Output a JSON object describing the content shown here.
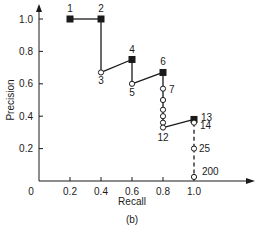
{
  "chart_data": {
    "type": "line",
    "title": "",
    "caption": "(b)",
    "xlabel": "Recall",
    "ylabel": "Precision",
    "xlim": [
      0,
      1.0
    ],
    "ylim": [
      0,
      1.0
    ],
    "grid": false,
    "x_ticks": [
      "0",
      "0.2",
      "0.4",
      "0.6",
      "0.8",
      "1.0"
    ],
    "y_ticks": [
      "0.2",
      "0.4",
      "0.6",
      "0.8",
      "1.0"
    ],
    "legend": null,
    "series": [
      {
        "name": "precision-recall",
        "points": [
          {
            "label": "1",
            "rank": 1,
            "recall": 0.2,
            "precision": 1.0,
            "relevant": true
          },
          {
            "label": "2",
            "rank": 2,
            "recall": 0.4,
            "precision": 1.0,
            "relevant": true
          },
          {
            "label": "3",
            "rank": 3,
            "recall": 0.4,
            "precision": 0.67,
            "relevant": false
          },
          {
            "label": "4",
            "rank": 4,
            "recall": 0.6,
            "precision": 0.75,
            "relevant": true
          },
          {
            "label": "5",
            "rank": 5,
            "recall": 0.6,
            "precision": 0.6,
            "relevant": false
          },
          {
            "label": "6",
            "rank": 6,
            "recall": 0.8,
            "precision": 0.67,
            "relevant": true
          },
          {
            "label": "7",
            "rank": 7,
            "recall": 0.8,
            "precision": 0.57,
            "relevant": false
          },
          {
            "label": "",
            "rank": 8,
            "recall": 0.8,
            "precision": 0.5,
            "relevant": false
          },
          {
            "label": "",
            "rank": 9,
            "recall": 0.8,
            "precision": 0.44,
            "relevant": false
          },
          {
            "label": "",
            "rank": 10,
            "recall": 0.8,
            "precision": 0.4,
            "relevant": false
          },
          {
            "label": "",
            "rank": 11,
            "recall": 0.8,
            "precision": 0.36,
            "relevant": false
          },
          {
            "label": "12",
            "rank": 12,
            "recall": 0.8,
            "precision": 0.33,
            "relevant": false
          },
          {
            "label": "13",
            "rank": 13,
            "recall": 1.0,
            "precision": 0.38,
            "relevant": true
          },
          {
            "label": "14",
            "rank": 14,
            "recall": 1.0,
            "precision": 0.36,
            "relevant": false
          },
          {
            "label": "25",
            "rank": 25,
            "recall": 1.0,
            "precision": 0.2,
            "relevant": false
          },
          {
            "label": "200",
            "rank": 200,
            "recall": 1.0,
            "precision": 0.025,
            "relevant": false
          }
        ]
      }
    ],
    "annotations": [
      "Dashed segment from rank 14 to rank 200 at recall 1.0"
    ],
    "colors": {
      "line": "#1a1a1a",
      "filled_marker": "#1a1a1a",
      "open_marker": "#ffffff"
    }
  }
}
